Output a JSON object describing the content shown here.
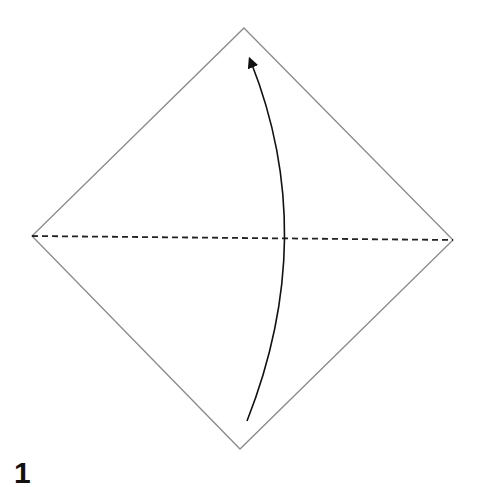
{
  "diagram": {
    "type": "origami-fold-instruction",
    "step_number": "1",
    "paper": {
      "shape": "square rotated 45deg (diamond)",
      "vertices": {
        "top": [
          244,
          28
        ],
        "right": [
          453,
          240
        ],
        "bottom": [
          240,
          449
        ],
        "left": [
          32,
          236
        ]
      },
      "edge_color": "#8a8a8a"
    },
    "fold_line": {
      "style": "dashed (valley fold)",
      "from": [
        32,
        236
      ],
      "to": [
        453,
        240
      ],
      "color": "#222222"
    },
    "arrow": {
      "meaning": "fold bottom corner up to top corner",
      "tail": [
        247,
        421
      ],
      "control": [
        318,
        236
      ],
      "head": [
        250,
        58
      ],
      "color": "#111111"
    }
  }
}
